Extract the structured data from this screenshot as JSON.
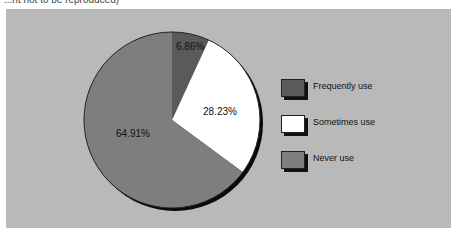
{
  "caption": "...nt not to be reproduced)",
  "chart_data": {
    "type": "pie",
    "title": "",
    "categories": [
      "Frequently use",
      "Sometimes use",
      "Never use"
    ],
    "values": [
      6.86,
      28.23,
      64.91
    ],
    "labels": [
      "6.86%",
      "28.23%",
      "64.91%"
    ],
    "colors": [
      "#5a5a5a",
      "#ffffff",
      "#7e7e7e"
    ],
    "legend_position": "right",
    "start_angle": "12 o'clock, clockwise",
    "background": "#b9b9b9"
  },
  "legend": {
    "items": [
      {
        "label": "Frequently use",
        "color": "#5a5a5a"
      },
      {
        "label": "Sometimes use",
        "color": "#ffffff"
      },
      {
        "label": "Never use",
        "color": "#7e7e7e"
      }
    ]
  }
}
